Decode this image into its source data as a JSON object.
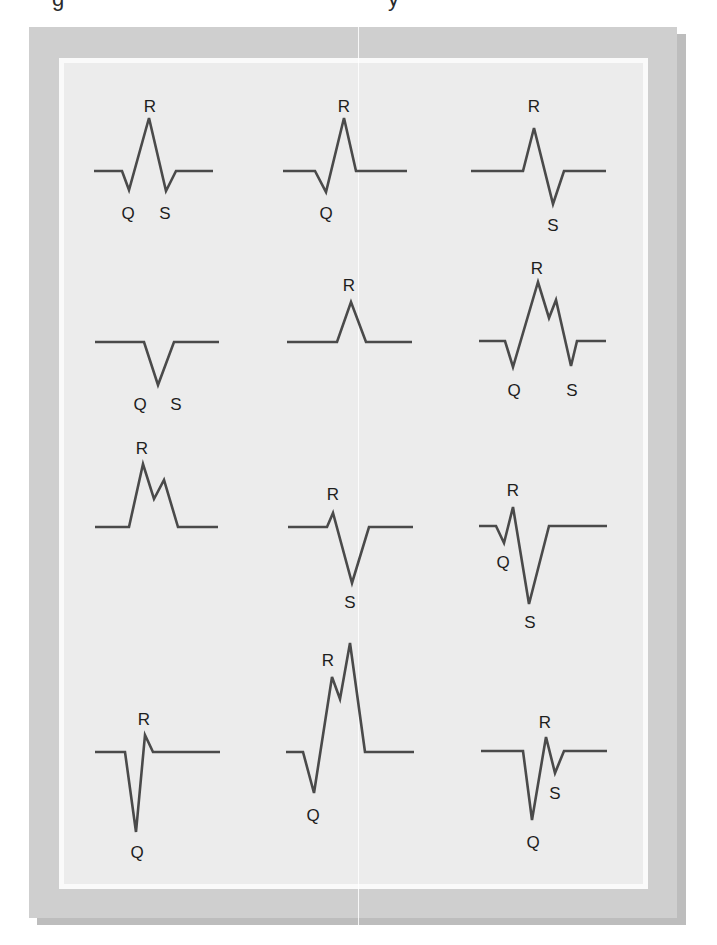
{
  "figure": {
    "stroke_color": "#4a4a4a",
    "panel_color": "#ececec",
    "frame_color": "#cfcfcf",
    "waveforms": [
      {
        "id": "qRs",
        "points": "94,171 122,171 129,190 149,118 166,191 176,171 213,171",
        "labels": [
          {
            "text": "R",
            "x": 150,
            "y": 112
          },
          {
            "text": "Q",
            "x": 128,
            "y": 219
          },
          {
            "text": "S",
            "x": 165,
            "y": 219
          }
        ]
      },
      {
        "id": "qR",
        "points": "283,171 315,171 326,192 344,118 356,171 407,171",
        "labels": [
          {
            "text": "R",
            "x": 344,
            "y": 112
          },
          {
            "text": "Q",
            "x": 326,
            "y": 219
          }
        ]
      },
      {
        "id": "Rs",
        "points": "471,171 523,171 534,128 553,204 564,171 606,171",
        "labels": [
          {
            "text": "R",
            "x": 534,
            "y": 112
          },
          {
            "text": "S",
            "x": 553,
            "y": 231
          }
        ]
      },
      {
        "id": "QS",
        "points": "95,342 144,342 158,385 174,342 219,342",
        "labels": [
          {
            "text": "Q",
            "x": 140,
            "y": 410
          },
          {
            "text": "S",
            "x": 176,
            "y": 410
          }
        ]
      },
      {
        "id": "R",
        "points": "287,342 337,342 351,302 366,342 412,342",
        "labels": [
          {
            "text": "R",
            "x": 349,
            "y": 291
          }
        ]
      },
      {
        "id": "qRR'S",
        "points": "479,341 505,341 513,367 538,282 549,318 556,300 571,366 577,341 606,341",
        "labels": [
          {
            "text": "R",
            "x": 537,
            "y": 274
          },
          {
            "text": "Q",
            "x": 514,
            "y": 396
          },
          {
            "text": "S",
            "x": 572,
            "y": 396
          }
        ]
      },
      {
        "id": "RR'",
        "points": "95,527 129,527 143,464 154,499 164,480 178,527 218,527",
        "labels": [
          {
            "text": "R",
            "x": 142,
            "y": 454
          }
        ]
      },
      {
        "id": "rS",
        "points": "288,527 327,527 333,513 352,583 369,527 413,527",
        "labels": [
          {
            "text": "R",
            "x": 333,
            "y": 500
          },
          {
            "text": "S",
            "x": 350,
            "y": 608
          }
        ]
      },
      {
        "id": "qrS",
        "points": "479,526 496,526 504,543 513,507 529,604 549,526 607,526",
        "labels": [
          {
            "text": "R",
            "x": 513,
            "y": 496
          },
          {
            "text": "Q",
            "x": 503,
            "y": 568
          },
          {
            "text": "S",
            "x": 530,
            "y": 628
          }
        ]
      },
      {
        "id": "Qr",
        "points": "95,752 125,752 136,832 145,735 153,752 220,752",
        "labels": [
          {
            "text": "R",
            "x": 144,
            "y": 725
          },
          {
            "text": "Q",
            "x": 137,
            "y": 858
          }
        ]
      },
      {
        "id": "QRR'",
        "points": "286,752 303,752 314,793 332,677 340,699 350,643 365,752 414,752",
        "labels": [
          {
            "text": "R",
            "x": 328,
            "y": 666
          },
          {
            "text": "Q",
            "x": 313,
            "y": 821
          }
        ]
      },
      {
        "id": "QrS",
        "points": "481,751 523,751 532,820 546,737 555,773 564,751 607,751",
        "labels": [
          {
            "text": "R",
            "x": 545,
            "y": 728
          },
          {
            "text": "S",
            "x": 555,
            "y": 799
          },
          {
            "text": "Q",
            "x": 533,
            "y": 848
          }
        ]
      }
    ]
  }
}
